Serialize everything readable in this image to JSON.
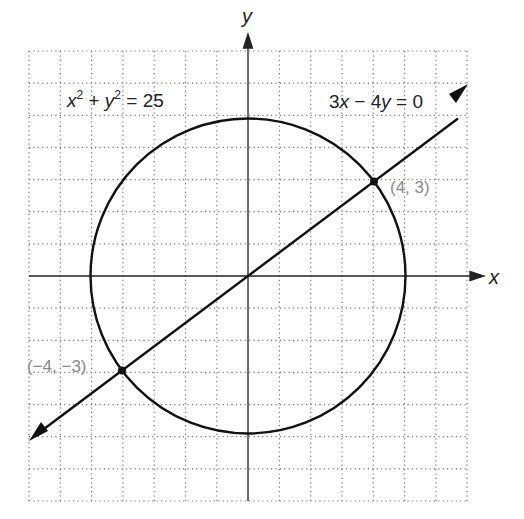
{
  "diagram": {
    "title": "",
    "axes": {
      "x_label": "x",
      "y_label": "y",
      "x_range": [
        -7,
        7
      ],
      "y_range": [
        -7,
        7
      ],
      "grid": "dotted, unit spacing"
    },
    "curves": [
      {
        "type": "circle",
        "equation": "x² + y² = 25",
        "center": [
          0,
          0
        ],
        "radius": 5
      },
      {
        "type": "line",
        "equation": "3x − 4y = 0",
        "slope": 0.75,
        "arrows": "both ends"
      }
    ],
    "equation_labels": {
      "circle": {
        "x": "x",
        "x_exp": "2",
        "plus": " + ",
        "y": "y",
        "y_exp": "2",
        "rhs": " = 25"
      },
      "line": {
        "c1": "3",
        "x": "x",
        "minus": " − 4",
        "y": "y",
        "rhs": " = 0"
      }
    },
    "points": [
      {
        "label": "(4, 3)",
        "x": 4,
        "y": 3
      },
      {
        "label": "(−4, −3)",
        "x": -4,
        "y": -3
      }
    ],
    "colors": {
      "curve": "#111111",
      "grid": "#777777",
      "point_label": "#8a8a8a"
    }
  }
}
